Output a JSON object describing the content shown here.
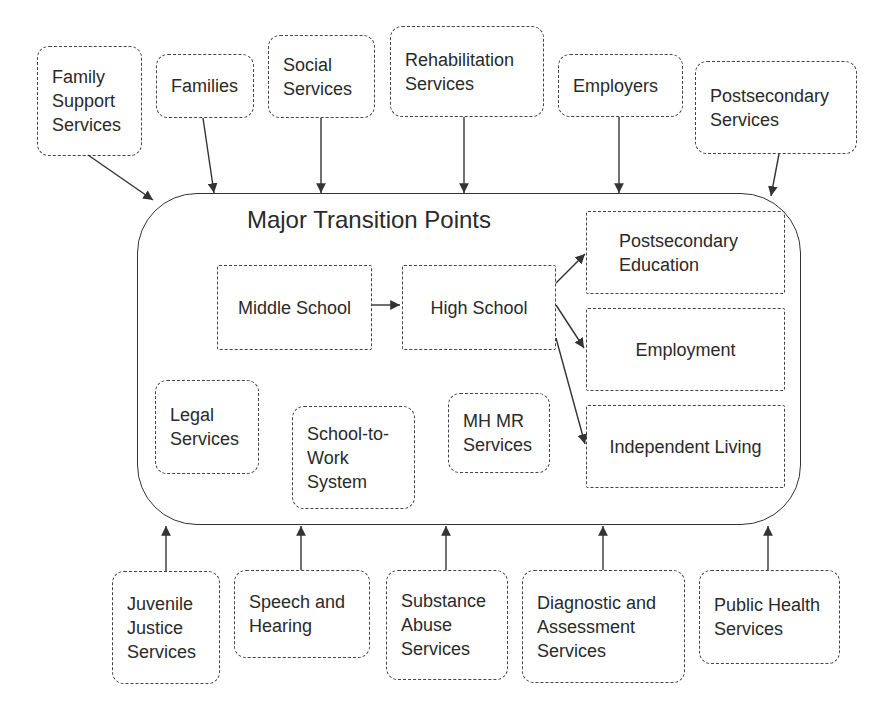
{
  "diagram": {
    "title": "Major Transition Points",
    "top_services": [
      {
        "id": "family-support-services",
        "label": "Family\nSupport\nServices",
        "x": 37,
        "y": 46,
        "w": 105,
        "h": 110
      },
      {
        "id": "families",
        "label": "Families",
        "x": 156,
        "y": 54,
        "w": 98,
        "h": 64
      },
      {
        "id": "social-services",
        "label": "Social\nServices",
        "x": 268,
        "y": 35,
        "w": 107,
        "h": 83
      },
      {
        "id": "rehabilitation-services",
        "label": "Rehabilitation\nServices",
        "x": 390,
        "y": 26,
        "w": 154,
        "h": 91
      },
      {
        "id": "employers",
        "label": "Employers",
        "x": 558,
        "y": 54,
        "w": 125,
        "h": 63
      },
      {
        "id": "postsecondary-services",
        "label": "Postsecondary\nServices",
        "x": 695,
        "y": 61,
        "w": 162,
        "h": 93
      }
    ],
    "inner_items": [
      {
        "id": "middle-school",
        "label": "Middle School",
        "x": 217,
        "y": 265,
        "w": 155,
        "h": 85,
        "style": "square center"
      },
      {
        "id": "high-school",
        "label": "High School",
        "x": 402,
        "y": 265,
        "w": 154,
        "h": 85,
        "style": "square center"
      },
      {
        "id": "postsecondary-education",
        "label": "Postsecondary\nEducation",
        "x": 586,
        "y": 211,
        "w": 199,
        "h": 83,
        "style": "square",
        "pad": 32
      },
      {
        "id": "employment",
        "label": "Employment",
        "x": 586,
        "y": 308,
        "w": 199,
        "h": 83,
        "style": "square center"
      },
      {
        "id": "independent-living",
        "label": "Independent Living",
        "x": 586,
        "y": 405,
        "w": 199,
        "h": 83,
        "style": "square center"
      },
      {
        "id": "legal-services",
        "label": "Legal\nServices",
        "x": 155,
        "y": 380,
        "w": 104,
        "h": 94,
        "style": ""
      },
      {
        "id": "school-to-work-system",
        "label": "School-to-\nWork\nSystem",
        "x": 292,
        "y": 406,
        "w": 123,
        "h": 103,
        "style": ""
      },
      {
        "id": "mh-mr-services",
        "label": "MH MR\nServices",
        "x": 448,
        "y": 393,
        "w": 102,
        "h": 80,
        "style": ""
      }
    ],
    "bottom_services": [
      {
        "id": "juvenile-justice-services",
        "label": "Juvenile\nJustice\nServices",
        "x": 112,
        "y": 571,
        "w": 108,
        "h": 113
      },
      {
        "id": "speech-and-hearing",
        "label": "Speech and\nHearing",
        "x": 234,
        "y": 570,
        "w": 136,
        "h": 88
      },
      {
        "id": "substance-abuse-services",
        "label": "Substance\nAbuse\nServices",
        "x": 386,
        "y": 570,
        "w": 122,
        "h": 110
      },
      {
        "id": "diagnostic-and-assessment-services",
        "label": "Diagnostic and\nAssessment\nServices",
        "x": 522,
        "y": 570,
        "w": 163,
        "h": 113
      },
      {
        "id": "public-health-services",
        "label": "Public Health\nServices",
        "x": 699,
        "y": 570,
        "w": 141,
        "h": 94
      }
    ],
    "arrows": [
      {
        "from": "family-support-services",
        "to": "main",
        "x1": 88,
        "y1": 155,
        "x2": 153,
        "y2": 200
      },
      {
        "from": "families",
        "to": "main",
        "x1": 203,
        "y1": 118,
        "x2": 214,
        "y2": 193
      },
      {
        "from": "social-services",
        "to": "main",
        "x1": 321,
        "y1": 118,
        "x2": 321,
        "y2": 193
      },
      {
        "from": "rehabilitation-services",
        "to": "main",
        "x1": 464,
        "y1": 117,
        "x2": 464,
        "y2": 193
      },
      {
        "from": "employers",
        "to": "main",
        "x1": 619,
        "y1": 117,
        "x2": 619,
        "y2": 193
      },
      {
        "from": "postsecondary-services",
        "to": "main",
        "x1": 779,
        "y1": 154,
        "x2": 771,
        "y2": 196
      },
      {
        "from": "middle-school",
        "to": "high-school",
        "x1": 372,
        "y1": 305,
        "x2": 400,
        "y2": 305
      },
      {
        "from": "high-school",
        "to": "postsecondary-education",
        "x1": 556,
        "y1": 283,
        "x2": 585,
        "y2": 254
      },
      {
        "from": "high-school",
        "to": "employment",
        "x1": 556,
        "y1": 305,
        "x2": 584,
        "y2": 348
      },
      {
        "from": "high-school",
        "to": "independent-living",
        "x1": 556,
        "y1": 338,
        "x2": 585,
        "y2": 444
      },
      {
        "from": "juvenile-justice-services",
        "to": "main",
        "x1": 166,
        "y1": 571,
        "x2": 166,
        "y2": 526
      },
      {
        "from": "speech-and-hearing",
        "to": "main",
        "x1": 301,
        "y1": 570,
        "x2": 301,
        "y2": 526
      },
      {
        "from": "substance-abuse-services",
        "to": "main",
        "x1": 446,
        "y1": 570,
        "x2": 446,
        "y2": 526
      },
      {
        "from": "diagnostic-and-assessment-services",
        "to": "main",
        "x1": 603,
        "y1": 570,
        "x2": 603,
        "y2": 526
      },
      {
        "from": "public-health-services",
        "to": "main",
        "x1": 768,
        "y1": 570,
        "x2": 768,
        "y2": 526
      }
    ],
    "colors": {
      "stroke": "#333333",
      "text": "#2a2a2a",
      "background": "#ffffff"
    }
  }
}
